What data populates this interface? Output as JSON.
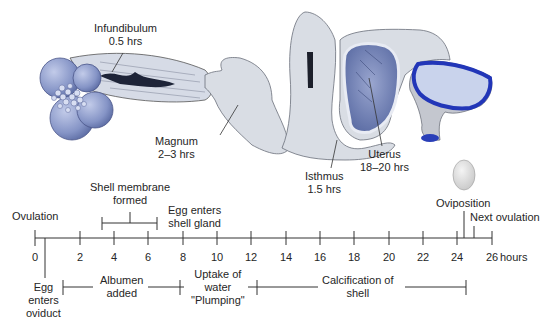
{
  "anatomy": {
    "infundibulum": {
      "name": "Infundibulum",
      "time": "0.5 hrs"
    },
    "magnum": {
      "name": "Magnum",
      "time": "2–3 hrs"
    },
    "isthmus": {
      "name": "Isthmus",
      "time": "1.5 hrs"
    },
    "uterus": {
      "name": "Uterus",
      "time": "18–20 hrs"
    }
  },
  "timeline": {
    "unit_label": "hours",
    "ticks": [
      "0",
      "2",
      "4",
      "6",
      "8",
      "10",
      "12",
      "14",
      "16",
      "18",
      "20",
      "22",
      "24",
      "26"
    ],
    "range": [
      0,
      26
    ],
    "events_above": {
      "ovulation": "Ovulation",
      "shell_membrane_line1": "Shell membrane",
      "shell_membrane_line2": "formed",
      "shell_gland_line1": "Egg enters",
      "shell_gland_line2": "shell gland",
      "oviposition": "Oviposition",
      "next_ovulation": "Next ovulation"
    },
    "events_below": {
      "egg_enters_line1": "Egg",
      "egg_enters_line2": "enters",
      "egg_enters_line3": "oviduct",
      "albumen_line1": "Albumen",
      "albumen_line2": "added",
      "water_line1": "Uptake of",
      "water_line2": "water",
      "water_line3": "\"Plumping\"",
      "calcification_line1": "Calcification of",
      "calcification_line2": "shell"
    }
  },
  "colors": {
    "ovary_blue": "#8e9dcc",
    "oviduct_gray": "#d9dde4",
    "uterus_blue": "#6d7fb3",
    "vagina_blue": "#2a3fb8",
    "line": "#333333"
  }
}
